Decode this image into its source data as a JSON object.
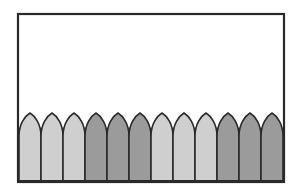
{
  "canvas": {
    "width": 295,
    "height": 194,
    "background": "#ffffff"
  },
  "frame": {
    "x": 18,
    "y": 14,
    "width": 266,
    "height": 168,
    "stroke": "#2a2a2a",
    "stroke_width": 2.2,
    "fill": "#ffffff"
  },
  "fence": {
    "left": 19,
    "right": 283,
    "bottom": 181,
    "tip_y": 113,
    "shoulder_y": 136,
    "stroke": "#2a2a2a",
    "stroke_width": 1.6,
    "colors": {
      "light": "#cfcfcf",
      "dark": "#9b9b9b"
    },
    "pickets": [
      {
        "index": 1,
        "shade": "light"
      },
      {
        "index": 2,
        "shade": "light"
      },
      {
        "index": 3,
        "shade": "light"
      },
      {
        "index": 4,
        "shade": "dark"
      },
      {
        "index": 5,
        "shade": "dark"
      },
      {
        "index": 6,
        "shade": "dark"
      },
      {
        "index": 7,
        "shade": "light"
      },
      {
        "index": 8,
        "shade": "light"
      },
      {
        "index": 9,
        "shade": "light"
      },
      {
        "index": 10,
        "shade": "dark"
      },
      {
        "index": 11,
        "shade": "dark"
      },
      {
        "index": 12,
        "shade": "dark"
      }
    ]
  }
}
